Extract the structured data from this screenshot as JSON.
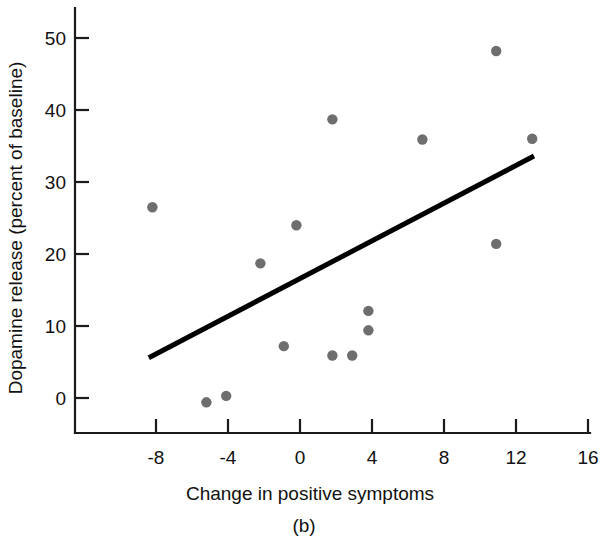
{
  "chart_data": {
    "type": "scatter",
    "title": "",
    "subtitle": "",
    "caption": "(b)",
    "xlabel": "Change in positive symptoms",
    "ylabel": "Dopamine release (percent of baseline)",
    "xlim": [
      -11,
      16
    ],
    "ylim": [
      -4,
      54
    ],
    "xticks": [
      -8,
      -4,
      0,
      4,
      8,
      12,
      16
    ],
    "xtick_labels": [
      "-8",
      "-4",
      "0",
      "4",
      "8",
      "12",
      "16"
    ],
    "yticks": [
      0,
      10,
      20,
      30,
      40,
      50
    ],
    "ytick_labels": [
      "0",
      "10",
      "20",
      "30",
      "40",
      "50"
    ],
    "grid": false,
    "legend": null,
    "point_color": "#6e6e6e",
    "line_color": "#000000",
    "axis_color": "#1a1a1a",
    "points": [
      {
        "x": -8.2,
        "y": 26.5
      },
      {
        "x": -5.2,
        "y": -0.6
      },
      {
        "x": -4.1,
        "y": 0.3
      },
      {
        "x": -2.2,
        "y": 18.7
      },
      {
        "x": -0.9,
        "y": 7.2
      },
      {
        "x": -0.2,
        "y": 24.0
      },
      {
        "x": 1.8,
        "y": 38.7
      },
      {
        "x": 1.8,
        "y": 5.9
      },
      {
        "x": 2.9,
        "y": 5.9
      },
      {
        "x": 3.8,
        "y": 12.1
      },
      {
        "x": 3.8,
        "y": 9.4
      },
      {
        "x": 6.8,
        "y": 35.9
      },
      {
        "x": 10.9,
        "y": 48.2
      },
      {
        "x": 10.9,
        "y": 21.4
      },
      {
        "x": 12.9,
        "y": 36.0
      }
    ],
    "trend_line": {
      "x_start": -8.4,
      "y_start": 5.6,
      "x_end": 13.0,
      "y_end": 33.6
    }
  }
}
